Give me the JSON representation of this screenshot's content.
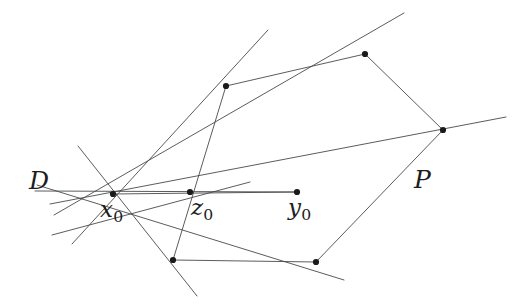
{
  "figure": {
    "width": 522,
    "height": 307,
    "background_color": "#ffffff",
    "stroke_color": "#4a4a4a",
    "vertex_color": "#1a1a1a",
    "stroke_width": 0.9,
    "vertex_radius": 3.1
  },
  "labels": {
    "domain": {
      "text": "D",
      "x": 29,
      "y": 168
    },
    "polygon": {
      "text": "P",
      "x": 414,
      "y": 167
    },
    "center_point": {
      "base": "x",
      "sub": "0",
      "x": 100,
      "y": 198
    },
    "mid_point": {
      "base": "z",
      "sub": "0",
      "x": 191,
      "y": 196
    },
    "end_point": {
      "base": "y",
      "sub": "0",
      "x": 288,
      "y": 196
    }
  },
  "points": {
    "x0": {
      "name": "x0",
      "x": 113,
      "y": 194,
      "marked": true
    },
    "z0": {
      "name": "z0",
      "x": 190,
      "y": 192,
      "marked": true
    },
    "y0": {
      "name": "y0",
      "x": 297,
      "y": 192,
      "marked": true
    },
    "v_top_left": {
      "name": "polygon-vertex-top-left",
      "x": 226,
      "y": 86,
      "marked": true
    },
    "v_top_right": {
      "name": "polygon-vertex-top-right",
      "x": 365,
      "y": 54,
      "marked": true
    },
    "v_right": {
      "name": "polygon-vertex-right",
      "x": 443,
      "y": 130,
      "marked": true
    },
    "v_bottom_right": {
      "name": "polygon-vertex-bottom-right",
      "x": 316,
      "y": 262,
      "marked": true
    },
    "v_bottom_left": {
      "name": "polygon-vertex-bottom-left",
      "x": 173,
      "y": 260,
      "marked": true
    }
  },
  "polygon_edges": [
    {
      "name": "edge-topleft-topright",
      "x1": 226,
      "y1": 86,
      "x2": 365,
      "y2": 54
    },
    {
      "name": "edge-topright-right",
      "x1": 365,
      "y1": 54,
      "x2": 443,
      "y2": 130
    },
    {
      "name": "edge-right-bottomright",
      "x1": 443,
      "y1": 130,
      "x2": 316,
      "y2": 262
    },
    {
      "name": "edge-bottomright-bottomleft",
      "x1": 316,
      "y1": 262,
      "x2": 173,
      "y2": 260
    },
    {
      "name": "edge-bottomleft-topleft",
      "x1": 173,
      "y1": 260,
      "x2": 226,
      "y2": 86
    }
  ],
  "pencil_lines": [
    {
      "name": "line-through-topleft",
      "x1": 72,
      "y1": 244,
      "x2": 268,
      "y2": 30
    },
    {
      "name": "line-through-topright",
      "x1": 54,
      "y1": 215,
      "x2": 404,
      "y2": 13
    },
    {
      "name": "line-through-right",
      "x1": 50,
      "y1": 204,
      "x2": 506,
      "y2": 117
    },
    {
      "name": "line-through-bottomright",
      "x1": 37,
      "y1": 185,
      "x2": 344,
      "y2": 280
    },
    {
      "name": "line-through-bottomleft",
      "x1": 78,
      "y1": 146,
      "x2": 197,
      "y2": 296
    },
    {
      "name": "line-horizontal-to-y0",
      "x1": 35,
      "y1": 191,
      "x2": 297,
      "y2": 192
    },
    {
      "name": "line-extra-lower-left",
      "x1": 52,
      "y1": 235,
      "x2": 250,
      "y2": 182
    }
  ],
  "segments": [
    {
      "name": "segment-x0-to-y0",
      "x1": 113,
      "y1": 194,
      "x2": 297,
      "y2": 192
    }
  ],
  "chart_data": {
    "type": "scatter",
    "title": "",
    "xlabel": "",
    "ylabel": "",
    "grid": false,
    "legend_position": "none",
    "annotations": [
      "D",
      "P",
      "x0",
      "z0",
      "y0"
    ],
    "series": [
      {
        "name": "polygon-P-vertices",
        "points": [
          [
            226,
            86
          ],
          [
            365,
            54
          ],
          [
            443,
            130
          ],
          [
            316,
            262
          ],
          [
            173,
            260
          ]
        ]
      },
      {
        "name": "ray-points",
        "points": [
          [
            113,
            194
          ],
          [
            190,
            192
          ],
          [
            297,
            192
          ]
        ]
      }
    ]
  }
}
